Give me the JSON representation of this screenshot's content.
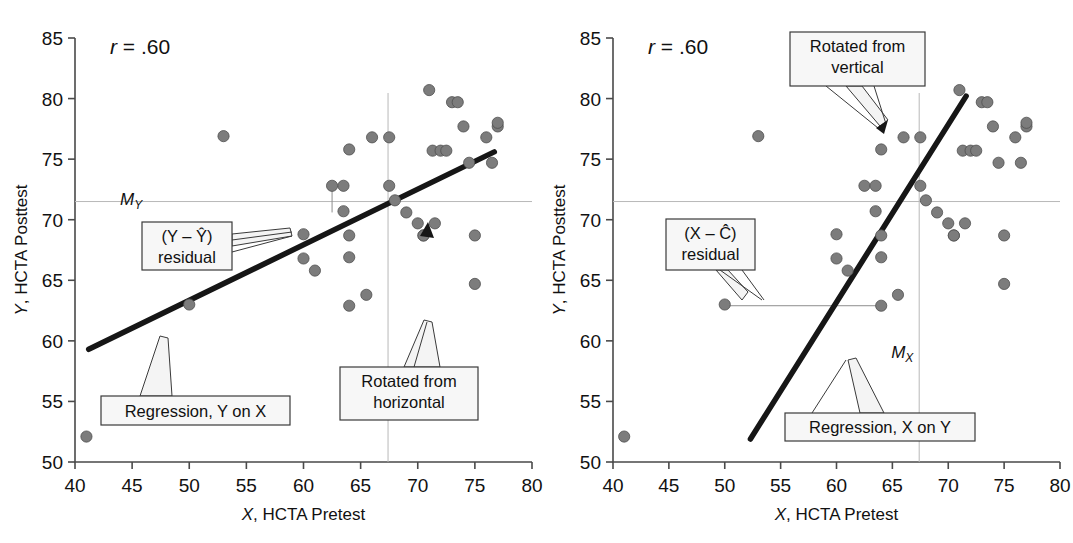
{
  "figure": {
    "type": "two-panel-scatter",
    "background": "#ffffff",
    "point_color": "#7c7c7c",
    "regression_color": "#161616",
    "meanline_color": "#b8b8b8"
  },
  "chart_data": [
    {
      "type": "scatter",
      "panel": "left",
      "title": "",
      "annotation_r": "r = .60",
      "r_symbol": "r",
      "r_value": "= .60",
      "xlabel_italic": "X",
      "xlabel_rest": ", HCTA Pretest",
      "ylabel_italic": "Y",
      "ylabel_rest": ", HCTA Posttest",
      "xlim": [
        40,
        80
      ],
      "ylim": [
        50,
        85
      ],
      "xticks": [
        40,
        45,
        50,
        55,
        60,
        65,
        70,
        75,
        80
      ],
      "yticks": [
        50,
        55,
        60,
        65,
        70,
        75,
        80,
        85
      ],
      "grid": false,
      "legend": "none",
      "mean_y": 71.5,
      "mean_x": 67.4,
      "mean_label_y": "M",
      "mean_label_y_sub": "Y",
      "regression_line": {
        "name": "Regression, Y on X",
        "x1": 41.2,
        "y1": 59.3,
        "x2": 76.7,
        "y2": 75.6
      },
      "residual_marker": {
        "x": 62.5,
        "y_point": 72.8,
        "y_fit": 70.6
      },
      "x": [
        41,
        50,
        53,
        60,
        60,
        61,
        62.5,
        63.5,
        63.5,
        64,
        64,
        64,
        64,
        65.5,
        66,
        67.5,
        67.5,
        68,
        69,
        70,
        70.5,
        70.5,
        71,
        71.3,
        71.5,
        72,
        72.5,
        73,
        73.5,
        74,
        74.5,
        75,
        75,
        76,
        76.5,
        77,
        77
      ],
      "y": [
        52.1,
        63.0,
        76.9,
        66.8,
        68.8,
        65.8,
        72.8,
        72.8,
        70.7,
        62.9,
        66.9,
        68.7,
        75.8,
        63.8,
        76.8,
        72.8,
        76.8,
        71.6,
        70.6,
        69.7,
        68.7,
        68.7,
        80.7,
        75.7,
        69.7,
        75.7,
        75.7,
        79.7,
        79.7,
        77.7,
        74.7,
        64.7,
        68.7,
        76.8,
        74.7,
        77.7,
        78.0
      ],
      "callouts": [
        {
          "id": "residual-y",
          "lines": [
            "(Y – Ŷ)",
            "residual"
          ],
          "box": [
            142,
            222,
            90,
            48
          ]
        },
        {
          "id": "regression-y-on-x",
          "lines": [
            "Regression, Y on X"
          ],
          "box": [
            101,
            396,
            189,
            29
          ]
        },
        {
          "id": "rotated-from-horizontal",
          "lines": [
            "Rotated from",
            "horizontal"
          ],
          "box": [
            340,
            367,
            138,
            53
          ]
        }
      ]
    },
    {
      "type": "scatter",
      "panel": "right",
      "title": "",
      "annotation_r": "r = .60",
      "r_symbol": "r",
      "r_value": "= .60",
      "xlabel_italic": "X",
      "xlabel_rest": ", HCTA Pretest",
      "ylabel_italic": "Y",
      "ylabel_rest": ", HCTA Posttest",
      "xlim": [
        40,
        80
      ],
      "ylim": [
        50,
        85
      ],
      "xticks": [
        40,
        45,
        50,
        55,
        60,
        65,
        70,
        75,
        80
      ],
      "yticks": [
        50,
        55,
        60,
        65,
        70,
        75,
        80,
        85
      ],
      "grid": false,
      "legend": "none",
      "mean_y": 71.5,
      "mean_x": 67.4,
      "mean_label_x": "M",
      "mean_label_x_sub": "X",
      "regression_line": {
        "name": "Regression, X on Y",
        "x1": 52.3,
        "y1": 51.9,
        "x2": 71.6,
        "y2": 80.2
      },
      "residual_marker": {
        "y": 62.9,
        "x_point": 50.0,
        "x_fit": 64.0
      },
      "x": [
        41,
        50,
        53,
        60,
        60,
        61,
        62.5,
        63.5,
        63.5,
        64,
        64,
        64,
        64,
        65.5,
        66,
        67.5,
        67.5,
        68,
        69,
        70,
        70.5,
        70.5,
        71,
        71.3,
        71.5,
        72,
        72.5,
        73,
        73.5,
        74,
        74.5,
        75,
        75,
        76,
        76.5,
        77,
        77
      ],
      "y": [
        52.1,
        63.0,
        76.9,
        66.8,
        68.8,
        65.8,
        72.8,
        72.8,
        70.7,
        62.9,
        66.9,
        68.7,
        75.8,
        63.8,
        76.8,
        72.8,
        76.8,
        71.6,
        70.6,
        69.7,
        68.7,
        68.7,
        80.7,
        75.7,
        69.7,
        75.7,
        75.7,
        79.7,
        79.7,
        77.7,
        74.7,
        64.7,
        68.7,
        76.8,
        74.7,
        77.7,
        78.0
      ],
      "callouts": [
        {
          "id": "residual-x",
          "lines": [
            "(X – Ĉ)",
            "residual"
          ],
          "box": [
            666,
            219,
            89,
            51
          ]
        },
        {
          "id": "regression-x-on-y",
          "lines": [
            "Regression, X on Y"
          ],
          "box": [
            785,
            413,
            190,
            28
          ]
        },
        {
          "id": "rotated-from-vertical",
          "lines": [
            "Rotated from",
            "vertical"
          ],
          "box": [
            790,
            32,
            135,
            54
          ]
        }
      ]
    }
  ],
  "labels": {
    "r_text": "r = .60",
    "x_axis": "X, HCTA Pretest",
    "y_axis": "Y, HCTA Posttest",
    "m_y": "MY",
    "m_x": "MX",
    "residual_y_line1": "(Y – Ŷ)",
    "residual_y_line2": "residual",
    "residual_x_line1": "(X – X̂)",
    "residual_x_line2": "residual",
    "regression_y_on_x": "Regression, Y on X",
    "regression_x_on_y": "Regression, X on Y",
    "rotated_horizontal_line1": "Rotated from",
    "rotated_horizontal_line2": "horizontal",
    "rotated_vertical_line1": "Rotated from",
    "rotated_vertical_line2": "vertical",
    "ticks_x": [
      "40",
      "45",
      "50",
      "55",
      "60",
      "65",
      "70",
      "75",
      "80"
    ],
    "ticks_y": [
      "85",
      "80",
      "75",
      "70",
      "65",
      "60",
      "55",
      "50"
    ]
  }
}
